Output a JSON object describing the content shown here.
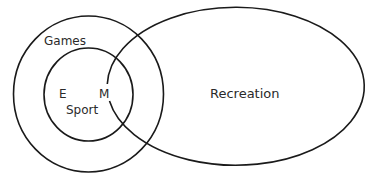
{
  "diagram": {
    "type": "venn",
    "stroke_color": "#1a1a1a",
    "text_color": "#2a2a2a",
    "sets": [
      {
        "id": "games",
        "label": "Games"
      },
      {
        "id": "sport",
        "label": "Sport"
      },
      {
        "id": "recreation",
        "label": "Recreation"
      }
    ],
    "points": [
      {
        "id": "e",
        "label": "E"
      },
      {
        "id": "m",
        "label": "M"
      }
    ]
  }
}
